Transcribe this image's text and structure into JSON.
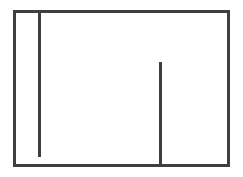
{
  "canvas": {
    "width": 243,
    "height": 177,
    "background_color": "#ffffff"
  },
  "figure": {
    "title": "",
    "stroke_color": "#3f3f3f",
    "stroke_width": 3,
    "line_cap": "butt",
    "outer_rectangle": {
      "name": "outer-rectangle",
      "x": 14.5,
      "y": 11.5,
      "width": 214,
      "height": 154,
      "fill": "none"
    },
    "inner_lines": [
      {
        "name": "left-vertical-line",
        "x": 39.5,
        "y1": 11.5,
        "y2": 157,
        "attached_top": true,
        "attached_bottom": false
      },
      {
        "name": "right-vertical-line",
        "x": 160.5,
        "y1": 62,
        "y2": 165.5,
        "attached_top": false,
        "attached_bottom": true
      }
    ]
  }
}
